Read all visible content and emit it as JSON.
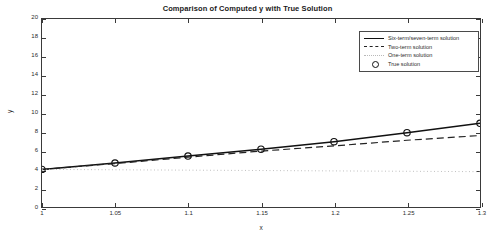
{
  "chart_data": {
    "type": "line",
    "title": "Comparison of Computed y with True Solution",
    "xlabel": "x",
    "ylabel": "y",
    "xlim": [
      1,
      1.3
    ],
    "ylim": [
      0,
      20
    ],
    "grid": false,
    "legend_position": "upper right",
    "xticks": [
      "1",
      "1.05",
      "1.1",
      "1.15",
      "1.2",
      "1.25",
      "1.3"
    ],
    "xtick_values": [
      1,
      1.05,
      1.1,
      1.15,
      1.2,
      1.25,
      1.3
    ],
    "yticks": [
      "0",
      "2",
      "4",
      "6",
      "8",
      "10",
      "12",
      "14",
      "16",
      "18",
      "20"
    ],
    "ytick_values": [
      0,
      2,
      4,
      6,
      8,
      10,
      12,
      14,
      16,
      18,
      20
    ],
    "x": [
      1,
      1.05,
      1.1,
      1.15,
      1.2,
      1.25,
      1.3
    ],
    "series": [
      {
        "name": "Six-term/seven-term solution",
        "style": "solid",
        "color": "#111111",
        "marker": "none",
        "values": [
          4.0,
          4.68,
          5.42,
          6.15,
          6.95,
          7.9,
          8.9
        ]
      },
      {
        "name": "Two-term solution",
        "style": "dashed",
        "color": "#222222",
        "marker": "none",
        "values": [
          4.0,
          4.62,
          5.3,
          5.95,
          6.5,
          7.1,
          7.6
        ]
      },
      {
        "name": "One-term solution",
        "style": "dotted",
        "color": "#b9b9b9",
        "marker": "none",
        "values": [
          4.0,
          3.96,
          3.92,
          3.88,
          3.84,
          3.8,
          3.76
        ]
      },
      {
        "name": "True solution",
        "style": "none",
        "color": "#111111",
        "marker": "circle",
        "values": [
          4.0,
          4.68,
          5.42,
          6.15,
          6.95,
          7.9,
          8.9
        ]
      }
    ]
  },
  "legend": {
    "items": [
      {
        "label": "Six-term/seven-term solution",
        "sample": "solid-line"
      },
      {
        "label": "Two-term solution",
        "sample": "dashed-line"
      },
      {
        "label": "One-term solution",
        "sample": "dotted-line"
      },
      {
        "label": "True solution",
        "sample": "circle-marker"
      }
    ]
  }
}
